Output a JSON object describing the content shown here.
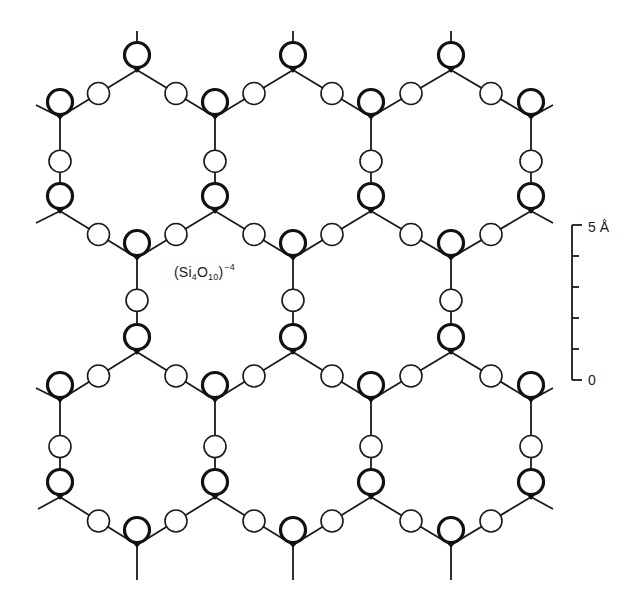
{
  "diagram": {
    "formula": {
      "prefix": "(Si",
      "si_sub": "4",
      "o": "O",
      "o_sub": "10",
      "suffix": ")",
      "charge": "−4"
    },
    "legend_note": "Thick circles: Si tetrahedra (black pole = apex junction); thin circles: bridging O",
    "colors": {
      "line": "#1a1a1a",
      "background": "#ffffff"
    },
    "scale_bar": {
      "top_label": "5 Å",
      "bottom_label": "0",
      "x": 572,
      "y_top": 225,
      "y_bottom": 380,
      "ticks": 6,
      "unit": "Å",
      "max": 5,
      "min": 0
    },
    "lattice": {
      "apex_x": [
        137,
        293,
        451
      ],
      "side_x": [
        60,
        215,
        371,
        531
      ],
      "rows": {
        "A": 70,
        "B": 117,
        "C": 211,
        "D": 258,
        "E": 352,
        "F": 400,
        "G": 497,
        "H": 545
      },
      "si_offset": -15,
      "si_radius": 12.5,
      "o_radius": 11
    }
  }
}
